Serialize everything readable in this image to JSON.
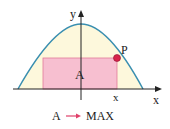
{
  "labels": {
    "y_axis": "y",
    "x_axis": "x",
    "x_point": "x",
    "point": "P",
    "area": "A",
    "caption_left": "A",
    "caption_right": "MAX"
  },
  "colors": {
    "curve": "#3a8fb0",
    "fill_under_curve": "#fdf8dc",
    "rectangle": "#f7bfd0",
    "rectangle_stroke": "#e07a9a",
    "point": "#d8244a",
    "arrow": "#e0406a",
    "axis": "#222222"
  }
}
